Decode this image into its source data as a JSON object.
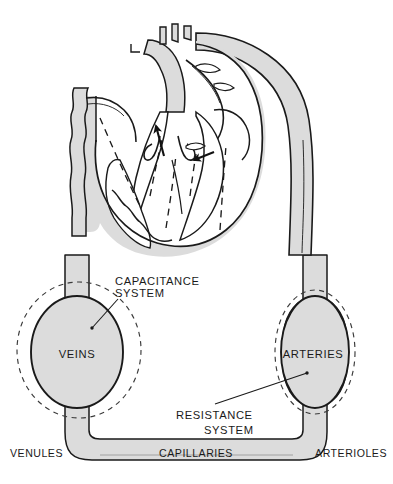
{
  "figure": {
    "background_color": "#ffffff",
    "vessel_fill_color": "#dcdcdc",
    "outline_color": "#1a1a1a",
    "text_color": "#1a1a1a"
  },
  "labels": {
    "capacitance_system_line1": "CAPACITANCE",
    "capacitance_system_line2": "SYSTEM",
    "resistance_system_line1": "RESISTANCE",
    "resistance_system_line2": "SYSTEM",
    "veins": "VEINS",
    "arteries": "ARTERIES",
    "venules": "VENULES",
    "capillaries": "CAPILLARIES",
    "arterioles": "ARTERIOLES"
  },
  "icons": {
    "flow_arrow_left": "arrow-up-icon",
    "flow_arrow_right": "arrow-down-left-icon",
    "dashed_flow_path": "dashed-flow-line-icon",
    "distensibility_outline": "dashed-ellipse-icon"
  },
  "structures": {
    "heart": "heart-cross-section",
    "aortic_arch": "aortic-arch",
    "descending_aorta": "descending-aorta",
    "vena_cava": "vena-cava",
    "venous_reservoir": "veins-reservoir",
    "arterial_reservoir": "arteries-reservoir",
    "capillary_bed": "capillary-bed"
  }
}
